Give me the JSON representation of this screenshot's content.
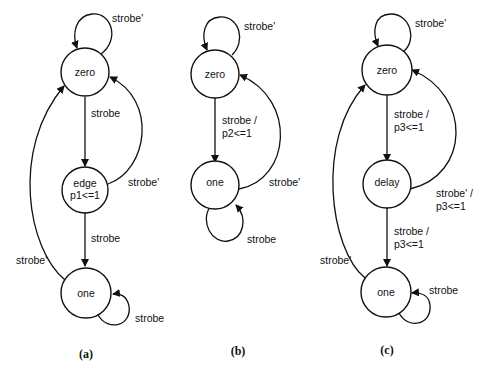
{
  "figure": {
    "diagrams": [
      {
        "caption": "(a)",
        "states": [
          {
            "id": "zero",
            "label": "zero"
          },
          {
            "id": "edge",
            "label": "edge",
            "output": "p1<=1"
          },
          {
            "id": "one",
            "label": "one"
          }
        ],
        "transitions": [
          {
            "from": "zero",
            "to": "zero",
            "label": "strobe'"
          },
          {
            "from": "zero",
            "to": "edge",
            "label": "strobe"
          },
          {
            "from": "edge",
            "to": "zero",
            "label": "strobe'"
          },
          {
            "from": "edge",
            "to": "one",
            "label": "strobe"
          },
          {
            "from": "one",
            "to": "zero",
            "label": "strobe'"
          },
          {
            "from": "one",
            "to": "one",
            "label": "strobe"
          }
        ]
      },
      {
        "caption": "(b)",
        "states": [
          {
            "id": "zero",
            "label": "zero"
          },
          {
            "id": "one",
            "label": "one"
          }
        ],
        "transitions": [
          {
            "from": "zero",
            "to": "zero",
            "label": "strobe'"
          },
          {
            "from": "zero",
            "to": "one",
            "label": "strobe /",
            "label2": "p2<=1"
          },
          {
            "from": "one",
            "to": "zero",
            "label": "strobe'"
          },
          {
            "from": "one",
            "to": "one",
            "label": "strobe"
          }
        ]
      },
      {
        "caption": "(c)",
        "states": [
          {
            "id": "zero",
            "label": "zero"
          },
          {
            "id": "delay",
            "label": "delay"
          },
          {
            "id": "one",
            "label": "one"
          }
        ],
        "transitions": [
          {
            "from": "zero",
            "to": "zero",
            "label": "strobe'"
          },
          {
            "from": "zero",
            "to": "delay",
            "label": "strobe /",
            "label2": "p3<=1"
          },
          {
            "from": "delay",
            "to": "zero",
            "label": "strobe' /",
            "label2": "p3<=1"
          },
          {
            "from": "delay",
            "to": "one",
            "label": "strobe /",
            "label2": "p3<=1"
          },
          {
            "from": "one",
            "to": "zero",
            "label": "strobe'"
          },
          {
            "from": "one",
            "to": "one",
            "label": "strobe"
          }
        ]
      }
    ]
  }
}
